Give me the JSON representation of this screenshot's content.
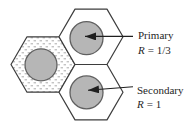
{
  "figure": {
    "type": "cellular-frequency-reuse-diagram",
    "cells": {
      "primary": {
        "label": "Primary",
        "r_symbol": "R",
        "r_value": "= 1/3"
      },
      "secondary": {
        "label": "Secondary",
        "r_symbol": "R",
        "r_value": "= 1"
      }
    },
    "colors": {
      "background": "#ffffff",
      "cell_fill": "#ffffff",
      "cell_outline": "#3d3d3d",
      "circle_fill": "#b6b6b6",
      "circle_outline": "#606060",
      "stipple_dash": "#ababab",
      "arrow": "#1f1f1f",
      "text": "#1f1f1f"
    }
  }
}
